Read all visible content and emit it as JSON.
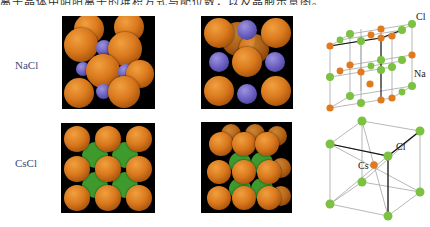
{
  "header": {
    "text": "离子晶体中阴阳离子的堆积方式与配位数，以及晶胞示意图。"
  },
  "rows": [
    {
      "label": "NaCl",
      "lattice_labels": [
        "Cl",
        "Na"
      ]
    },
    {
      "label": "CsCl",
      "lattice_labels": [
        "Cl",
        "Cs"
      ]
    }
  ],
  "colors": {
    "chloride": "#d9781c",
    "sodium": "#6a5fc0",
    "cesium_fill": "#3f9a2e",
    "lattice_green": "#7cc142",
    "lattice_orange": "#e07a1e"
  }
}
